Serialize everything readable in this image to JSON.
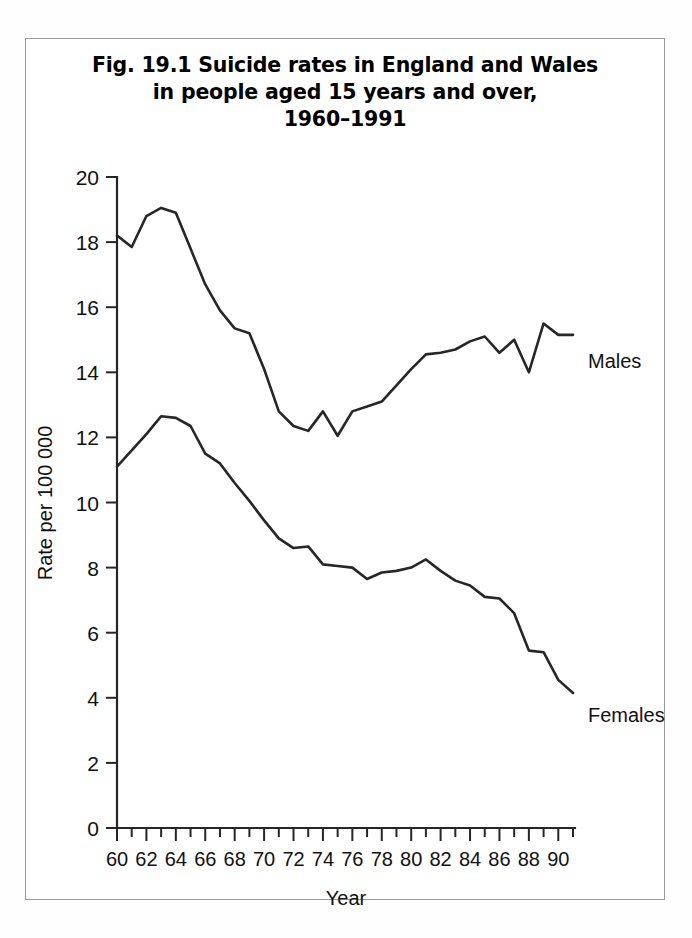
{
  "figure": {
    "title": "Fig. 19.1  Suicide rates in England and Wales\nin people aged 15 years and over,\n1960–1991",
    "title_line1": "Fig. 19.1  Suicide rates in England and Wales",
    "title_line2": "in people aged 15 years and over,",
    "title_line3": "1960–1991"
  },
  "chart_data": {
    "type": "line",
    "xlabel": "Year",
    "ylabel": "Rate per 100 000",
    "xlim": [
      1960,
      1991
    ],
    "ylim": [
      0,
      20
    ],
    "yticks": [
      0,
      2,
      4,
      6,
      8,
      10,
      12,
      14,
      16,
      18,
      20
    ],
    "ytick_labels": [
      "0",
      "2",
      "4",
      "6",
      "8",
      "10",
      "12",
      "14",
      "16",
      "18",
      "20"
    ],
    "xticks": [
      1960,
      1962,
      1964,
      1966,
      1968,
      1970,
      1972,
      1974,
      1976,
      1978,
      1980,
      1982,
      1984,
      1986,
      1988,
      1990
    ],
    "xtick_labels": [
      "60",
      "62",
      "64",
      "66",
      "68",
      "70",
      "72",
      "74",
      "76",
      "78",
      "80",
      "82",
      "84",
      "86",
      "88",
      "90"
    ],
    "xtick_minor_every": 1,
    "grid": false,
    "legend_position": "inline-right-of-line-ends",
    "x": [
      1960,
      1961,
      1962,
      1963,
      1964,
      1965,
      1966,
      1967,
      1968,
      1969,
      1970,
      1971,
      1972,
      1973,
      1974,
      1975,
      1976,
      1977,
      1978,
      1979,
      1980,
      1981,
      1982,
      1983,
      1984,
      1985,
      1986,
      1987,
      1988,
      1989,
      1990,
      1991
    ],
    "series": [
      {
        "name": "Males",
        "label": "Males",
        "color": "#262626",
        "values": [
          18.2,
          17.85,
          18.8,
          19.05,
          18.9,
          17.8,
          16.7,
          15.9,
          15.35,
          15.2,
          14.1,
          12.8,
          12.35,
          12.2,
          12.8,
          12.05,
          12.8,
          12.95,
          13.1,
          13.6,
          14.1,
          14.55,
          14.6,
          14.7,
          14.95,
          15.1,
          14.6,
          15.0,
          14.0,
          15.5,
          15.15,
          15.15
        ]
      },
      {
        "name": "Females",
        "label": "Females",
        "color": "#262626",
        "values": [
          11.1,
          11.6,
          12.1,
          12.65,
          12.6,
          12.35,
          11.5,
          11.2,
          10.6,
          10.05,
          9.45,
          8.9,
          8.6,
          8.65,
          8.1,
          8.05,
          8.0,
          7.65,
          7.85,
          7.9,
          8.0,
          8.25,
          7.9,
          7.6,
          7.45,
          7.1,
          7.05,
          6.6,
          5.45,
          5.4,
          4.55,
          4.15
        ]
      }
    ]
  },
  "axes": {
    "y_axis_title": "Rate per 100 000",
    "x_axis_title": "Year"
  },
  "labels": {
    "males": "Males",
    "females": "Females"
  }
}
